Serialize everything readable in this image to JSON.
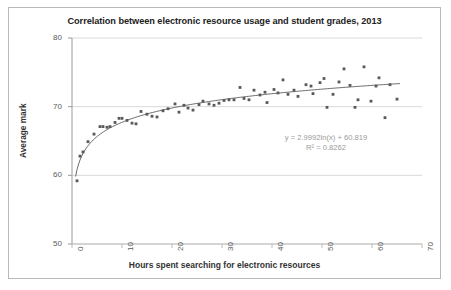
{
  "chart_data": {
    "type": "scatter",
    "title": "Correlation between electronic resource usage and student grades, 2013",
    "xlabel": "Hours spent searching for electronic resources",
    "ylabel": "Average mark",
    "xlim": [
      0,
      70
    ],
    "ylim": [
      50,
      80
    ],
    "xticks": [
      "0",
      "10",
      "20",
      "30",
      "40",
      "50",
      "60",
      "70"
    ],
    "yticks": [
      "50",
      "60",
      "70",
      "80"
    ],
    "grid": true,
    "legend": "none",
    "marker_color": "#595959",
    "trendline_color": "#595959",
    "gridline_color": "#d9d9d9",
    "annotations": {
      "equation": "y = 2.9992ln(x) + 60.819",
      "r_squared": "R² = 0.8262"
    },
    "trendline": {
      "type": "logarithmic",
      "slope": 2.9992,
      "intercept": 60.819,
      "r2": 0.8262
    },
    "points": [
      [
        1.0,
        59.2
      ],
      [
        1.6,
        62.8
      ],
      [
        2.2,
        63.4
      ],
      [
        3.2,
        64.9
      ],
      [
        4.4,
        66.0
      ],
      [
        5.6,
        67.1
      ],
      [
        6.2,
        67.1
      ],
      [
        7.0,
        67.0
      ],
      [
        7.6,
        67.1
      ],
      [
        8.6,
        67.7
      ],
      [
        9.4,
        68.3
      ],
      [
        10.0,
        68.3
      ],
      [
        11.0,
        68.0
      ],
      [
        12.0,
        67.6
      ],
      [
        12.8,
        67.5
      ],
      [
        13.8,
        69.3
      ],
      [
        15.0,
        68.9
      ],
      [
        16.0,
        68.6
      ],
      [
        17.0,
        68.5
      ],
      [
        18.2,
        69.4
      ],
      [
        19.2,
        69.7
      ],
      [
        20.6,
        70.4
      ],
      [
        21.4,
        69.2
      ],
      [
        22.4,
        70.2
      ],
      [
        23.2,
        69.8
      ],
      [
        24.2,
        69.5
      ],
      [
        25.4,
        70.3
      ],
      [
        26.2,
        70.8
      ],
      [
        27.4,
        70.4
      ],
      [
        28.4,
        70.2
      ],
      [
        29.4,
        70.5
      ],
      [
        30.4,
        70.9
      ],
      [
        31.4,
        71.0
      ],
      [
        32.4,
        71.0
      ],
      [
        33.6,
        72.8
      ],
      [
        34.4,
        71.2
      ],
      [
        35.4,
        71.0
      ],
      [
        36.4,
        72.4
      ],
      [
        37.6,
        71.7
      ],
      [
        38.6,
        72.1
      ],
      [
        39.0,
        70.6
      ],
      [
        40.4,
        72.5
      ],
      [
        41.2,
        72.0
      ],
      [
        42.2,
        73.9
      ],
      [
        43.2,
        71.8
      ],
      [
        44.4,
        72.4
      ],
      [
        45.2,
        71.5
      ],
      [
        46.8,
        73.2
      ],
      [
        47.8,
        73.0
      ],
      [
        48.2,
        71.9
      ],
      [
        49.6,
        73.5
      ],
      [
        50.4,
        74.1
      ],
      [
        51.0,
        69.9
      ],
      [
        52.2,
        71.8
      ],
      [
        53.4,
        73.6
      ],
      [
        54.4,
        75.5
      ],
      [
        55.6,
        73.1
      ],
      [
        56.6,
        69.9
      ],
      [
        57.2,
        71.0
      ],
      [
        58.4,
        75.8
      ],
      [
        59.8,
        70.8
      ],
      [
        60.8,
        73.0
      ],
      [
        61.4,
        74.2
      ],
      [
        62.6,
        68.4
      ],
      [
        63.6,
        73.2
      ],
      [
        65.0,
        71.1
      ]
    ]
  }
}
